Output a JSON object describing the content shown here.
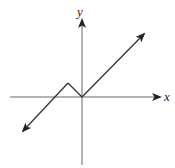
{
  "figure": {
    "type": "function-graph",
    "axes": {
      "x_label": "x",
      "y_label": "y",
      "x_label_pos": [
        165,
        101
      ],
      "y_label_pos": [
        77,
        16
      ]
    },
    "colors": {
      "axis": "#555555",
      "curve": "#333333",
      "label": "#222222"
    },
    "origin_px": [
      82,
      97
    ],
    "curve_points_px": [
      [
        23,
        131
      ],
      [
        68,
        83
      ],
      [
        82,
        97
      ],
      [
        144,
        34
      ]
    ],
    "key_points": {
      "peak": "left of origin, above x-axis",
      "vertex": "origin",
      "x_intercept_left": "negative x"
    }
  }
}
